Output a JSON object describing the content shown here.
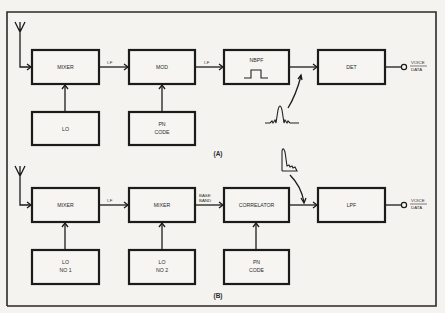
{
  "diagram": {
    "type": "block-diagram",
    "panels": [
      {
        "caption": "(A)",
        "input": "antenna",
        "blocks": {
          "mixer": "MIXER",
          "mod": "MOD",
          "nbpf": "NBPF",
          "det": "DET",
          "lo": "LO",
          "pn_code_line1": "PN",
          "pn_code_line2": "CODE"
        },
        "links": {
          "mixer_to_mod": "I-F",
          "mod_to_nbpf": "I-F"
        },
        "output": {
          "line1": "VOICE",
          "line2": "DATA"
        },
        "annotation": "narrowband spectrum (sinc-like) after NBPF"
      },
      {
        "caption": "(B)",
        "input": "antenna",
        "blocks": {
          "mixer1": "MIXER",
          "mixer2": "MIXER",
          "correlator": "CORRELATOR",
          "lpf": "LPF",
          "lo1_line1": "LO",
          "lo1_line2": "NO 1",
          "lo2_line1": "LO",
          "lo2_line2": "NO 2",
          "pn_code_line1": "PN",
          "pn_code_line2": "CODE"
        },
        "links": {
          "mixer1_to_mixer2": "I-F",
          "mixer2_to_correlator_line1": "BASE",
          "mixer2_to_correlator_line2": "BAND"
        },
        "output": {
          "line1": "VOICE",
          "line2": "DATA"
        },
        "annotation": "baseband spectrum after correlator"
      }
    ],
    "colors": {
      "ink": "#1b1b1b",
      "paper": "#f4f3ef"
    }
  }
}
